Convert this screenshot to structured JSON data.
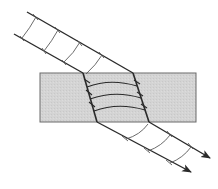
{
  "diagram": {
    "title": "Refraction of a wave beam through a parallel-sided slab",
    "colors": {
      "background": "#ffffff",
      "slab_fill": "#d4d4d4",
      "slab_stroke": "#6a6a6a",
      "ray": "#2a2a2a",
      "wavefront": "#5a5a5a"
    },
    "slab": {
      "x": 40,
      "y": 73,
      "width": 156,
      "height": 49
    },
    "rays": [
      {
        "name": "upper-ray",
        "incident": [
          [
            27,
            12
          ],
          [
            133,
            73
          ]
        ],
        "inside": [
          [
            133,
            73
          ],
          [
            149,
            122
          ]
        ],
        "emergent": [
          [
            149,
            122
          ],
          [
            210,
            158
          ]
        ]
      },
      {
        "name": "lower-ray",
        "incident": [
          [
            14,
            34
          ],
          [
            83,
            73
          ]
        ],
        "inside": [
          [
            83,
            73
          ],
          [
            97,
            122
          ]
        ],
        "emergent": [
          [
            97,
            122
          ],
          [
            191,
            172
          ]
        ]
      }
    ],
    "wavefronts_incident_count": 4,
    "wavefronts_inside_count": 3,
    "wavefronts_emergent_count": 3,
    "arrowheads": 2
  }
}
